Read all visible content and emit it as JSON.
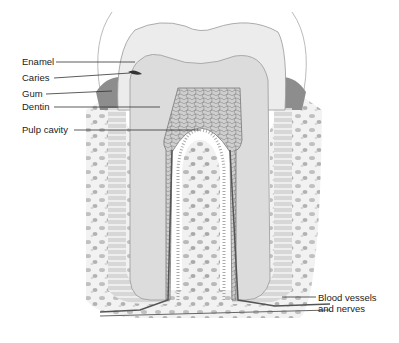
{
  "diagram": {
    "type": "anatomical-illustration",
    "labels": [
      {
        "text": "Enamel",
        "x": 22,
        "y": 56
      },
      {
        "text": "Caries",
        "x": 22,
        "y": 72
      },
      {
        "text": "Gum",
        "x": 22,
        "y": 88
      },
      {
        "text": "Dentin",
        "x": 22,
        "y": 101
      },
      {
        "text": "Pulp cavity",
        "x": 22,
        "y": 124
      },
      {
        "text": "Blood vessels",
        "x": 318,
        "y": 292
      },
      {
        "text": "and nerves",
        "x": 318,
        "y": 303
      }
    ],
    "colors": {
      "enamel": "#e9e9e9",
      "dentin": "#dcdcdc",
      "pulp": "#c8c8c8",
      "gum": "#8a8a8a",
      "bone": "#efefef",
      "line": "#333333"
    }
  }
}
